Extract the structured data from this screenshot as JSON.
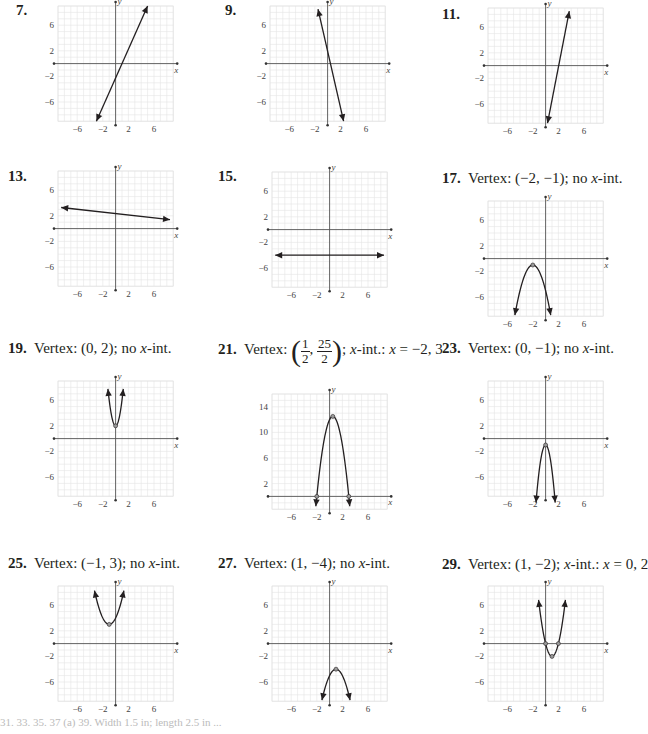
{
  "page": {
    "footer_fragment": "31.   33.   35.   37 (a)   39. Width 1.5 in; length 2.5 in ..."
  },
  "problems": [
    {
      "id": "7",
      "number": "7.",
      "caption": ""
    },
    {
      "id": "9",
      "number": "9.",
      "caption": ""
    },
    {
      "id": "11",
      "number": "11.",
      "caption": ""
    },
    {
      "id": "13",
      "number": "13.",
      "caption": ""
    },
    {
      "id": "15",
      "number": "15.",
      "caption": ""
    },
    {
      "id": "17",
      "number": "17.",
      "caption_pre": "Vertex: (−2, −1); no ",
      "caption_x": "x",
      "caption_post": "-int."
    },
    {
      "id": "19",
      "number": "19.",
      "caption_pre": "Vertex: (0, 2); no ",
      "caption_x": "x",
      "caption_post": "-int."
    },
    {
      "id": "21",
      "number": "21.",
      "caption_pre": "Vertex: ",
      "frac1_top": "1",
      "frac1_bot": "2",
      "frac2_top": "25",
      "frac2_bot": "2",
      "caption_mid": "; ",
      "caption_x": "x",
      "caption_post": "-int.: ",
      "caption_x2": "x",
      "caption_end": " = −2, 3"
    },
    {
      "id": "23",
      "number": "23.",
      "caption_pre": "Vertex: (0, −1); no ",
      "caption_x": "x",
      "caption_post": "-int."
    },
    {
      "id": "25",
      "number": "25.",
      "caption_pre": "Vertex: (−1, 3); no ",
      "caption_x": "x",
      "caption_post": "-int."
    },
    {
      "id": "27",
      "number": "27.",
      "caption_pre": "Vertex: (1, −4); no ",
      "caption_x": "x",
      "caption_post": "-int."
    },
    {
      "id": "29",
      "number": "29.",
      "caption_pre": "Vertex: (1, −2); ",
      "caption_x": "x",
      "caption_post": "-int.: ",
      "caption_x2": "x",
      "caption_end": " = 0, 2"
    }
  ],
  "chart_data": [
    {
      "id": "7",
      "type": "line",
      "title": "7.",
      "xlabel": "x",
      "ylabel": "y",
      "xlim": [
        -9,
        9
      ],
      "ylim": [
        -9,
        9
      ],
      "xticks": [
        -6,
        -2,
        2,
        6
      ],
      "yticks": [
        6,
        2,
        -2,
        -6
      ],
      "grid": true,
      "curve": {
        "kind": "line",
        "points": [
          [
            -3,
            -9
          ],
          [
            5,
            9
          ]
        ]
      },
      "arrows": "both"
    },
    {
      "id": "9",
      "type": "line",
      "title": "9.",
      "xlabel": "x",
      "ylabel": "y",
      "xlim": [
        -9,
        9
      ],
      "ylim": [
        -9,
        9
      ],
      "xticks": [
        -6,
        -2,
        2,
        6
      ],
      "yticks": [
        6,
        2,
        -2,
        -6
      ],
      "grid": true,
      "curve": {
        "kind": "line",
        "points": [
          [
            -1.5,
            8.5
          ],
          [
            2.5,
            -9
          ]
        ]
      },
      "arrows": "both"
    },
    {
      "id": "11",
      "type": "line",
      "title": "11.",
      "xlabel": "x",
      "ylabel": "y",
      "xlim": [
        -9,
        9
      ],
      "ylim": [
        -9,
        9
      ],
      "xticks": [
        -6,
        -2,
        2,
        6
      ],
      "yticks": [
        6,
        2,
        -2,
        -6
      ],
      "grid": true,
      "curve": {
        "kind": "line",
        "points": [
          [
            0.3,
            -9
          ],
          [
            3.7,
            8.5
          ]
        ]
      },
      "arrows": "both"
    },
    {
      "id": "13",
      "type": "line",
      "title": "13.",
      "xlabel": "x",
      "ylabel": "y",
      "xlim": [
        -9,
        9
      ],
      "ylim": [
        -9,
        9
      ],
      "xticks": [
        -6,
        -2,
        2,
        6
      ],
      "yticks": [
        6,
        2,
        -2,
        -6
      ],
      "grid": true,
      "curve": {
        "kind": "line",
        "points": [
          [
            -8.5,
            3.3
          ],
          [
            8.5,
            1.4
          ]
        ]
      },
      "arrows": "both"
    },
    {
      "id": "15",
      "type": "line",
      "title": "15.",
      "xlabel": "x",
      "ylabel": "y",
      "xlim": [
        -9,
        9
      ],
      "ylim": [
        -9,
        9
      ],
      "xticks": [
        -6,
        -2,
        2,
        6
      ],
      "yticks": [
        6,
        2,
        -2,
        -6
      ],
      "grid": true,
      "curve": {
        "kind": "line",
        "points": [
          [
            -8.5,
            -4
          ],
          [
            8.5,
            -4
          ]
        ]
      },
      "arrows": "both"
    },
    {
      "id": "17",
      "type": "line",
      "title": "Vertex: (-2, -1); no x-int.",
      "xlabel": "x",
      "ylabel": "y",
      "xlim": [
        -9,
        9
      ],
      "ylim": [
        -9,
        9
      ],
      "xticks": [
        -6,
        -2,
        2,
        6
      ],
      "yticks": [
        6,
        2,
        -2,
        -6
      ],
      "grid": true,
      "curve": {
        "kind": "parabola",
        "a": -1,
        "h": -2,
        "k": -1,
        "xrange": [
          -4.8,
          0.8
        ]
      },
      "vertex": [
        -2,
        -1
      ],
      "arrows": "both"
    },
    {
      "id": "19",
      "type": "line",
      "title": "Vertex: (0, 2); no x-int.",
      "xlabel": "x",
      "ylabel": "y",
      "xlim": [
        -9,
        9
      ],
      "ylim": [
        -9,
        9
      ],
      "xticks": [
        -6,
        -2,
        2,
        6
      ],
      "yticks": [
        6,
        2,
        -2,
        -6
      ],
      "grid": true,
      "curve": {
        "kind": "parabola",
        "a": 4,
        "h": 0,
        "k": 2,
        "xrange": [
          -1.2,
          1.2
        ]
      },
      "vertex": [
        0,
        2
      ],
      "arrows": "both"
    },
    {
      "id": "21",
      "type": "line",
      "title": "Vertex: (1/2, 25/2); x-int.: x = -2, 3",
      "xlabel": "x",
      "ylabel": "y",
      "xlim": [
        -9,
        9
      ],
      "ylim": [
        -2,
        16
      ],
      "xticks": [
        -6,
        -2,
        2,
        6
      ],
      "yticks": [
        14,
        10,
        6,
        2
      ],
      "grid": true,
      "curve": {
        "kind": "parabola",
        "a": -2,
        "h": 0.5,
        "k": 12.5,
        "xrange": [
          -2.15,
          3.15
        ]
      },
      "vertex": [
        0.5,
        12.5
      ],
      "points": [
        [
          -2,
          0
        ],
        [
          3,
          0
        ]
      ],
      "arrows": "both"
    },
    {
      "id": "23",
      "type": "line",
      "title": "Vertex: (0, -1); no x-int.",
      "xlabel": "x",
      "ylabel": "y",
      "xlim": [
        -9,
        9
      ],
      "ylim": [
        -9,
        9
      ],
      "xticks": [
        -6,
        -2,
        2,
        6
      ],
      "yticks": [
        6,
        2,
        -2,
        -6
      ],
      "grid": true,
      "curve": {
        "kind": "parabola",
        "a": -4,
        "h": 0,
        "k": -1,
        "xrange": [
          -1.5,
          1.5
        ]
      },
      "vertex": [
        0,
        -1
      ],
      "arrows": "both"
    },
    {
      "id": "25",
      "type": "line",
      "title": "Vertex: (-1, 3); no x-int.",
      "xlabel": "x",
      "ylabel": "y",
      "xlim": [
        -9,
        9
      ],
      "ylim": [
        -9,
        9
      ],
      "xticks": [
        -6,
        -2,
        2,
        6
      ],
      "yticks": [
        6,
        2,
        -2,
        -6
      ],
      "grid": true,
      "curve": {
        "kind": "parabola",
        "a": 1,
        "h": -1,
        "k": 3,
        "xrange": [
          -3.3,
          1.3
        ]
      },
      "vertex": [
        -1,
        3
      ],
      "arrows": "both"
    },
    {
      "id": "27",
      "type": "line",
      "title": "Vertex: (1, -4); no x-int.",
      "xlabel": "x",
      "ylabel": "y",
      "xlim": [
        -9,
        9
      ],
      "ylim": [
        -9,
        9
      ],
      "xticks": [
        -6,
        -2,
        2,
        6
      ],
      "yticks": [
        6,
        2,
        -2,
        -6
      ],
      "grid": true,
      "curve": {
        "kind": "parabola",
        "a": -1,
        "h": 1,
        "k": -4,
        "xrange": [
          -1.2,
          3.2
        ]
      },
      "vertex": [
        1,
        -4
      ],
      "arrows": "both"
    },
    {
      "id": "29",
      "type": "line",
      "title": "Vertex: (1, -2); x-int.: x = 0, 2",
      "xlabel": "x",
      "ylabel": "y",
      "xlim": [
        -9,
        9
      ],
      "ylim": [
        -9,
        9
      ],
      "xticks": [
        -6,
        -2,
        2,
        6
      ],
      "yticks": [
        6,
        2,
        -2,
        -6
      ],
      "grid": true,
      "curve": {
        "kind": "parabola",
        "a": 2,
        "h": 1,
        "k": -2,
        "xrange": [
          -1.1,
          3.1
        ]
      },
      "vertex": [
        1,
        -2
      ],
      "points": [
        [
          0,
          0
        ],
        [
          2,
          0
        ]
      ],
      "arrows": "both"
    }
  ]
}
